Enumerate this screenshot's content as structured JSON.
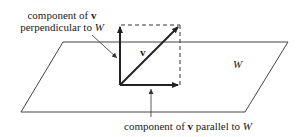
{
  "diagram": {
    "plane_label": "W",
    "vector_label": "v",
    "perp_label": {
      "line1_text": "component of ",
      "line1_vec": "v",
      "line2_text": "perpendicular to ",
      "line2_space": "W"
    },
    "parallel_label": {
      "text": "component of ",
      "vec": "v",
      "text2": " parallel to ",
      "space": "W"
    },
    "colors": {
      "line": "#333333",
      "background": "#ffffff"
    }
  }
}
